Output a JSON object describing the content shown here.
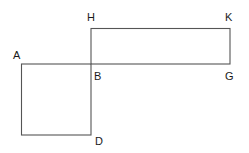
{
  "diagram": {
    "type": "geometry-figure",
    "points": [
      {
        "label": "A",
        "x": 21,
        "y": 64
      },
      {
        "label": "B",
        "x": 91,
        "y": 64
      },
      {
        "label": "D",
        "x": 91,
        "y": 135
      },
      {
        "label": "H",
        "x": 91,
        "y": 28
      },
      {
        "label": "K",
        "x": 230,
        "y": 28
      },
      {
        "label": "G",
        "x": 230,
        "y": 64
      }
    ],
    "labels": {
      "A": "A",
      "B": "B",
      "D": "D",
      "H": "H",
      "K": "K",
      "G": "G"
    },
    "shapes": [
      {
        "name": "square",
        "vertices": [
          "A",
          "B",
          "D",
          "(unlabeled bottom-left)"
        ]
      },
      {
        "name": "rectangle",
        "vertices": [
          "H",
          "K",
          "G",
          "B"
        ]
      }
    ],
    "colors": {
      "line": "#555555",
      "text": "#1a1a1a",
      "background": "#ffffff"
    }
  }
}
